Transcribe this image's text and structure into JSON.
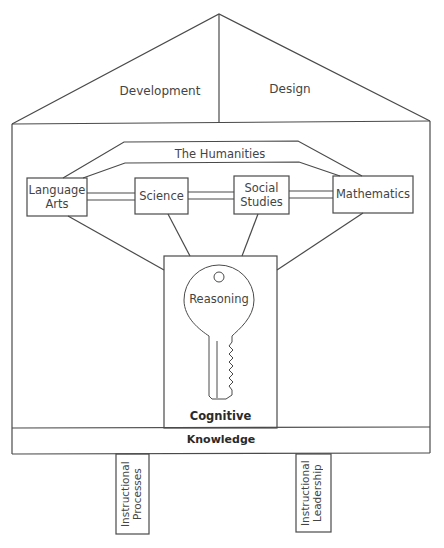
{
  "roof": {
    "left_label": "Development",
    "right_label": "Design"
  },
  "arch": {
    "label": "The Humanities"
  },
  "subjects": [
    {
      "label_line1": "Language",
      "label_line2": "Arts"
    },
    {
      "label_line1": "Science",
      "label_line2": ""
    },
    {
      "label_line1": "Social",
      "label_line2": "Studies"
    },
    {
      "label_line1": "Mathematics",
      "label_line2": ""
    }
  ],
  "key": {
    "head_label": "Reasoning",
    "box_label": "Cognitive"
  },
  "foundation": {
    "label": "Knowledge"
  },
  "pillars": [
    {
      "line1": "Instructional",
      "line2": "Processes"
    },
    {
      "line1": "Instructional",
      "line2": "Leadership"
    }
  ],
  "colors": {
    "stroke": "#4a4a4a",
    "text": "#444444",
    "background": "#ffffff"
  }
}
